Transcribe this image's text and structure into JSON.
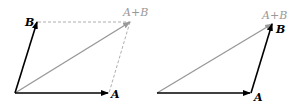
{
  "diagrams": [
    {
      "name": "parallelogram-rule",
      "labels": {
        "a": "A",
        "b": "B",
        "sum": "A+B"
      }
    },
    {
      "name": "triangle-rule",
      "labels": {
        "a": "A",
        "b": "B",
        "sum": "A+B"
      }
    }
  ],
  "colors": {
    "vector": "#000000",
    "sum": "#999999",
    "dashed": "#999999"
  }
}
